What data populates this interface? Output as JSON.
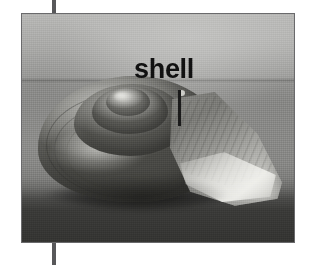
{
  "figure": {
    "caption_label": "shell",
    "color_mode": "grayscale"
  },
  "annotation": {
    "label_text": "shell",
    "leader_line": "vertical-leader-line",
    "points_to": "shell body whorl"
  },
  "markers": {
    "top_rule": "",
    "bottom_rule": ""
  },
  "photo": {
    "alt": "Grayscale photograph of a snail shell resting on a dark surface",
    "backdrop_color": "#b2b2b0",
    "ground_color": "#34342f",
    "shell_color": "#8e8e8a",
    "highlight_color": "#dadad6",
    "shadow_color": "#1a1a18"
  }
}
